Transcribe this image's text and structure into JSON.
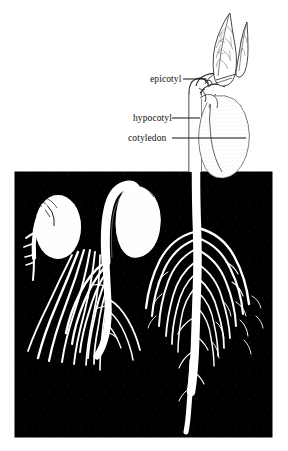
{
  "figure": {
    "background_color": "#ffffff",
    "soil_color": "#000000",
    "plant_color": "#ffffff",
    "line_color": "#111111",
    "soil_panel": {
      "x": 15,
      "y": 172,
      "width": 257,
      "height": 265
    },
    "labels": [
      {
        "id": "epicotyl",
        "text": "epicotyl",
        "x": 150,
        "y": 75,
        "leader_from_x": 183,
        "leader_to_x": 206,
        "leader_y": 79
      },
      {
        "id": "hypocotyl",
        "text": "hypocotyl",
        "x": 133,
        "y": 114,
        "leader_from_x": 172,
        "leader_to_x": 200,
        "leader_y": 118
      },
      {
        "id": "cotyledon",
        "text": "cotyledon",
        "x": 128,
        "y": 134,
        "leader_from_x": 172,
        "leader_to_x": 246,
        "leader_y": 138
      }
    ],
    "stages": [
      {
        "id": "stage-1",
        "name": "seed-with-radicle",
        "position": "left"
      },
      {
        "id": "stage-2",
        "name": "arched-hypocotyl-hook",
        "position": "center"
      },
      {
        "id": "stage-3",
        "name": "erect-seedling-with-leaves",
        "position": "right"
      }
    ]
  }
}
